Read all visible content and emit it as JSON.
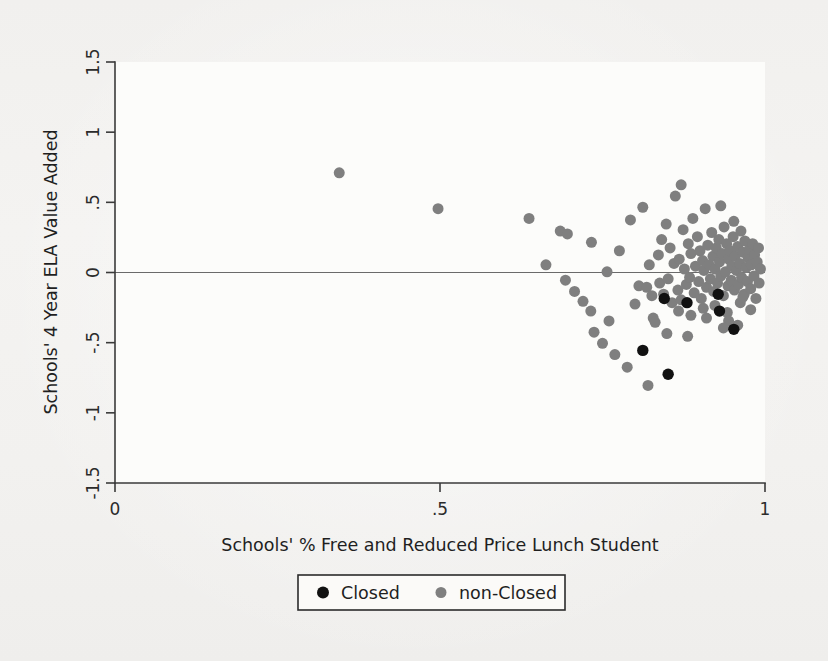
{
  "figure": {
    "background_color": "#f2f1ef",
    "plot_background_color": "#fbfbf9",
    "width": 828,
    "height": 661
  },
  "axes": {
    "x_title": "Schools' % Free and Reduced Price Lunch Student",
    "y_title": "Schools' 4 Year ELA Value Added",
    "x_ticks": [
      "0",
      ".5",
      "1"
    ],
    "y_ticks": [
      "1.5",
      "1",
      ".5",
      "0",
      "-.5",
      "-1",
      "-1.5"
    ]
  },
  "legend": {
    "items": [
      {
        "label": "Closed",
        "color": "#111111",
        "marker": "circle"
      },
      {
        "label": "non-Closed",
        "color": "#7f7f7f",
        "marker": "circle"
      }
    ]
  },
  "chart_data": {
    "type": "scatter",
    "title": "",
    "xlabel": "Schools' % Free and Reduced Price Lunch Student",
    "ylabel": "Schools' 4 Year ELA Value Added",
    "xlim": [
      0,
      1
    ],
    "ylim": [
      -1.5,
      1.5
    ],
    "xticks": [
      0,
      0.5,
      1
    ],
    "xticklabels": [
      "0",
      ".5",
      "1"
    ],
    "yticks": [
      1.5,
      1,
      0.5,
      0,
      -0.5,
      -1,
      -1.5
    ],
    "yticklabels": [
      "1.5",
      "1",
      ".5",
      "0",
      "-.5",
      "-1",
      "-1.5"
    ],
    "grid": false,
    "reference_lines": [
      {
        "axis": "y",
        "value": 0,
        "color": "#6a6a6a"
      }
    ],
    "legend_position": "below-axis-centered",
    "marker_size_px": 11,
    "series": [
      {
        "name": "non-Closed",
        "color": "#7f7f7f",
        "points": [
          [
            0.345,
            0.71
          ],
          [
            0.497,
            0.455
          ],
          [
            0.637,
            0.385
          ],
          [
            0.663,
            0.055
          ],
          [
            0.685,
            0.295
          ],
          [
            0.696,
            0.275
          ],
          [
            0.693,
            -0.055
          ],
          [
            0.707,
            -0.135
          ],
          [
            0.72,
            -0.205
          ],
          [
            0.732,
            -0.275
          ],
          [
            0.733,
            0.215
          ],
          [
            0.737,
            -0.425
          ],
          [
            0.75,
            -0.505
          ],
          [
            0.757,
            0.005
          ],
          [
            0.76,
            -0.345
          ],
          [
            0.769,
            -0.585
          ],
          [
            0.776,
            0.155
          ],
          [
            0.788,
            -0.675
          ],
          [
            0.793,
            0.375
          ],
          [
            0.8,
            -0.225
          ],
          [
            0.806,
            -0.095
          ],
          [
            0.812,
            0.465
          ],
          [
            0.818,
            -0.105
          ],
          [
            0.82,
            -0.805
          ],
          [
            0.822,
            0.055
          ],
          [
            0.826,
            -0.165
          ],
          [
            0.828,
            -0.325
          ],
          [
            0.831,
            -0.355
          ],
          [
            0.836,
            0.125
          ],
          [
            0.838,
            -0.075
          ],
          [
            0.841,
            0.235
          ],
          [
            0.844,
            -0.155
          ],
          [
            0.848,
            0.345
          ],
          [
            0.851,
            -0.045
          ],
          [
            0.854,
            0.175
          ],
          [
            0.857,
            -0.215
          ],
          [
            0.86,
            0.065
          ],
          [
            0.862,
            0.545
          ],
          [
            0.866,
            -0.125
          ],
          [
            0.868,
            0.095
          ],
          [
            0.871,
            -0.195
          ],
          [
            0.874,
            0.305
          ],
          [
            0.876,
            0.025
          ],
          [
            0.879,
            -0.085
          ],
          [
            0.882,
            0.205
          ],
          [
            0.884,
            -0.035
          ],
          [
            0.886,
            0.135
          ],
          [
            0.889,
            0.385
          ],
          [
            0.891,
            -0.145
          ],
          [
            0.893,
            0.045
          ],
          [
            0.896,
            0.255
          ],
          [
            0.898,
            -0.065
          ],
          [
            0.9,
            0.155
          ],
          [
            0.902,
            -0.185
          ],
          [
            0.904,
            0.085
          ],
          [
            0.906,
            0.015
          ],
          [
            0.908,
            0.455
          ],
          [
            0.91,
            -0.105
          ],
          [
            0.912,
            0.195
          ],
          [
            0.914,
            0.055
          ],
          [
            0.916,
            -0.045
          ],
          [
            0.918,
            0.285
          ],
          [
            0.92,
            0.115
          ],
          [
            0.921,
            -0.135
          ],
          [
            0.923,
            0.025
          ],
          [
            0.925,
            0.175
          ],
          [
            0.927,
            -0.075
          ],
          [
            0.929,
            0.235
          ],
          [
            0.93,
            0.075
          ],
          [
            0.932,
            -0.025
          ],
          [
            0.934,
            0.135
          ],
          [
            0.936,
            -0.165
          ],
          [
            0.937,
            0.325
          ],
          [
            0.939,
            0.005
          ],
          [
            0.941,
            0.205
          ],
          [
            0.943,
            -0.095
          ],
          [
            0.944,
            0.095
          ],
          [
            0.946,
            0.155
          ],
          [
            0.948,
            -0.055
          ],
          [
            0.949,
            0.045
          ],
          [
            0.951,
            0.255
          ],
          [
            0.953,
            -0.125
          ],
          [
            0.954,
            0.115
          ],
          [
            0.956,
            0.015
          ],
          [
            0.958,
            0.185
          ],
          [
            0.959,
            -0.085
          ],
          [
            0.961,
            0.065
          ],
          [
            0.963,
            0.295
          ],
          [
            0.964,
            -0.035
          ],
          [
            0.966,
            0.145
          ],
          [
            0.968,
            -0.155
          ],
          [
            0.969,
            0.225
          ],
          [
            0.971,
            0.035
          ],
          [
            0.973,
            -0.065
          ],
          [
            0.974,
            0.105
          ],
          [
            0.976,
            0.165
          ],
          [
            0.978,
            -0.115
          ],
          [
            0.979,
            0.055
          ],
          [
            0.981,
            0.205
          ],
          [
            0.983,
            -0.025
          ],
          [
            0.984,
            0.125
          ],
          [
            0.986,
            -0.185
          ],
          [
            0.988,
            0.075
          ],
          [
            0.99,
            0.175
          ],
          [
            0.991,
            -0.075
          ],
          [
            0.993,
            0.025
          ],
          [
            0.871,
            0.625
          ],
          [
            0.932,
            0.475
          ],
          [
            0.952,
            0.365
          ],
          [
            0.905,
            -0.255
          ],
          [
            0.923,
            -0.235
          ],
          [
            0.942,
            -0.285
          ],
          [
            0.962,
            -0.215
          ],
          [
            0.978,
            -0.265
          ],
          [
            0.886,
            -0.305
          ],
          [
            0.867,
            -0.275
          ],
          [
            0.944,
            -0.345
          ],
          [
            0.966,
            -0.175
          ],
          [
            0.849,
            -0.435
          ],
          [
            0.881,
            -0.455
          ],
          [
            0.936,
            -0.395
          ],
          [
            0.958,
            -0.375
          ],
          [
            0.91,
            -0.325
          ]
        ]
      },
      {
        "name": "Closed",
        "color": "#111111",
        "points": [
          [
            0.845,
            -0.185
          ],
          [
            0.88,
            -0.215
          ],
          [
            0.928,
            -0.155
          ],
          [
            0.93,
            -0.275
          ],
          [
            0.952,
            -0.405
          ],
          [
            0.812,
            -0.555
          ],
          [
            0.851,
            -0.725
          ]
        ]
      }
    ]
  }
}
